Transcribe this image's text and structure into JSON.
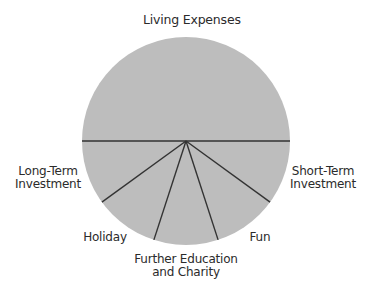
{
  "chart_data": {
    "type": "pie",
    "title": "",
    "categories": [
      "Living Expenses",
      "Short-Term Investment",
      "Fun",
      "Further Education and Charity",
      "Holiday",
      "Long-Term Investment"
    ],
    "values": [
      50,
      10,
      10,
      10,
      10,
      10
    ],
    "unit": "%",
    "fill_color": "#bdbdbd",
    "line_color": "#333333",
    "legend": "none (labels placed around pie)",
    "grid": false
  },
  "labels": {
    "living_expenses": "Living Expenses",
    "long_term": {
      "line1": "Long-Term",
      "line2": "Investment"
    },
    "short_term": {
      "line1": "Short-Term",
      "line2": "Investment"
    },
    "holiday": "Holiday",
    "fun": "Fun",
    "further_education": {
      "line1": "Further Education",
      "line2": "and Charity"
    }
  }
}
